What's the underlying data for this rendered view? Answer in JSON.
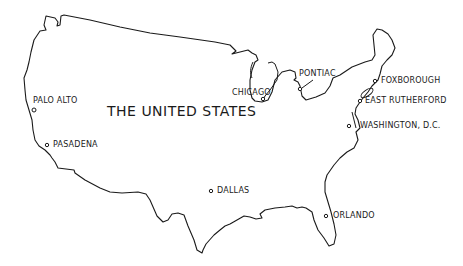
{
  "map": {
    "title": "THE UNITED STATES",
    "line_color": "#1a1a1a",
    "background": "#ffffff",
    "cities": [
      {
        "name": "PALO ALTO",
        "x": 35,
        "y": 109
      },
      {
        "name": "PASADENA",
        "x": 47,
        "y": 145
      },
      {
        "name": "CHICAGO",
        "x": 265,
        "y": 98
      },
      {
        "name": "PONTIAC",
        "x": 300,
        "y": 91
      },
      {
        "name": "FOXBOROUGH",
        "x": 375,
        "y": 81
      },
      {
        "name": "EAST RUTHERFORD",
        "x": 360,
        "y": 101
      },
      {
        "name": "WASHINGTON, D.C.",
        "x": 349,
        "y": 126
      },
      {
        "name": "DALLAS",
        "x": 210,
        "y": 191
      },
      {
        "name": "ORLANDO",
        "x": 326,
        "y": 216
      }
    ]
  }
}
